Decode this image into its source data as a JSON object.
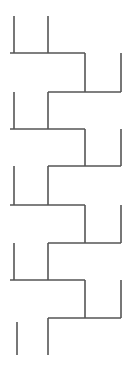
{
  "diagram": {
    "type": "staircase-line-pattern",
    "stroke_color": "#555555",
    "background": "#ffffff",
    "columns_x": [
      14,
      48,
      85,
      121
    ],
    "left_horizontals_y": [
      53,
      129,
      205,
      280
    ],
    "right_horizontals_y": [
      92,
      166,
      243,
      318
    ]
  }
}
